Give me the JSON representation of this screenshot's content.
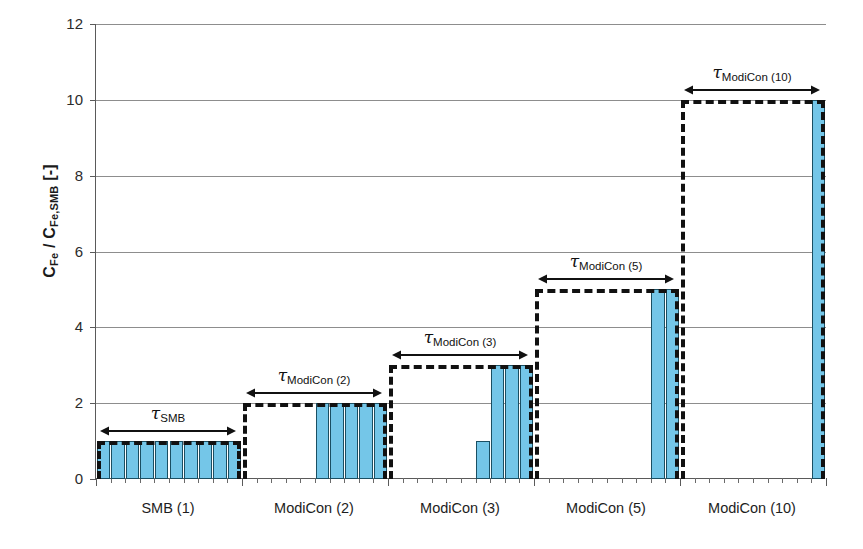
{
  "chart_data": {
    "type": "bar",
    "title": "",
    "subtitle": "",
    "xlabel": "",
    "ylabel": "C_Fe / C_Fe,SMB [-]",
    "ylabel_parts": {
      "main1": "C",
      "sub1": "Fe",
      "slash": " / ",
      "main2": "C",
      "sub2": "Fe,SMB",
      "unit": " [-]"
    },
    "ylim": [
      0,
      12
    ],
    "yticks": [
      0,
      2,
      4,
      6,
      8,
      10,
      12
    ],
    "ytick_labels": [
      "0",
      "2",
      "4",
      "6",
      "8",
      "10",
      "12"
    ],
    "grid": true,
    "grid_axis": "y",
    "legend": "none",
    "bar_color": "#74c6e8",
    "bar_edge_color": "#1a4f63",
    "annotation_color": "#111111",
    "categories": [
      "SMB (1)",
      "ModiCon (2)",
      "ModiCon (3)",
      "ModiCon (5)",
      "ModiCon (10)"
    ],
    "slots_per_group": 10,
    "groups": [
      {
        "label": "SMB (1)",
        "cycle_level": 1,
        "bar_values": [
          1,
          1,
          1,
          1,
          1,
          1,
          1,
          1,
          1,
          1
        ],
        "tau_label": "SMB"
      },
      {
        "label": "ModiCon (2)",
        "cycle_level": 2,
        "bar_values": [
          0,
          0,
          0,
          0,
          0,
          2,
          2,
          2,
          2,
          2
        ],
        "tau_label": "ModiCon (2)"
      },
      {
        "label": "ModiCon (3)",
        "cycle_level": 3,
        "bar_values": [
          0,
          0,
          0,
          0,
          0,
          0,
          1,
          3,
          3,
          3
        ],
        "tau_label": "ModiCon (3)"
      },
      {
        "label": "ModiCon (5)",
        "cycle_level": 5,
        "bar_values": [
          0,
          0,
          0,
          0,
          0,
          0,
          0,
          0,
          5,
          5
        ],
        "tau_label": "ModiCon (5)"
      },
      {
        "label": "ModiCon (10)",
        "cycle_level": 10,
        "bar_values": [
          0,
          0,
          0,
          0,
          0,
          0,
          0,
          0,
          0,
          10
        ],
        "tau_label": "ModiCon (10)"
      }
    ],
    "annotations": [
      {
        "name": "tau-smb",
        "tau_sym": "τ",
        "tau_sub": "SMB",
        "group": 0
      },
      {
        "name": "tau-modicon-2",
        "tau_sym": "τ",
        "tau_sub": "ModiCon (2)",
        "group": 1
      },
      {
        "name": "tau-modicon-3",
        "tau_sym": "τ",
        "tau_sub": "ModiCon (3)",
        "group": 2
      },
      {
        "name": "tau-modicon-5",
        "tau_sym": "τ",
        "tau_sub": "ModiCon (5)",
        "group": 3
      },
      {
        "name": "tau-modicon-10",
        "tau_sym": "τ",
        "tau_sub": "ModiCon (10)",
        "group": 4
      }
    ]
  }
}
